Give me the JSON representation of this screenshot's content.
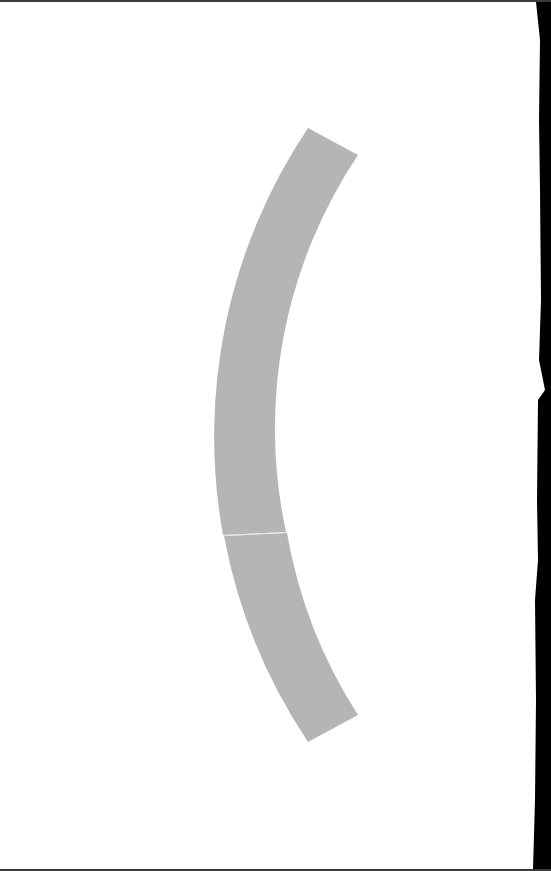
{
  "page": {
    "width": 551,
    "height": 871,
    "background_color": "#ffffff",
    "edge_color": "#000000"
  },
  "shape": {
    "type": "arc-band",
    "description": "curved band shaped like an opening parenthesis",
    "fill_color": "#b5b5b5",
    "seam_color": "#e6e6e6",
    "segments": 2
  }
}
